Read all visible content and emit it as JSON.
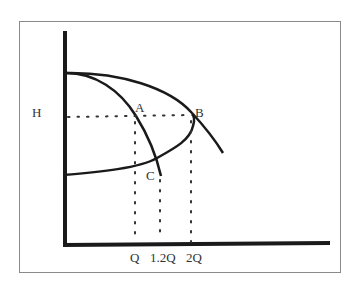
{
  "diagram": {
    "type": "pump head-capacity curves",
    "y_axis_label": "H",
    "x_tick_labels": [
      "Q",
      "1.2Q",
      "2Q"
    ],
    "points": [
      {
        "label": "A"
      },
      {
        "label": "B"
      },
      {
        "label": "C"
      }
    ],
    "colors": {
      "line": "#1a1a1a",
      "frame": "#8a8a8a",
      "text": "#333333"
    }
  }
}
